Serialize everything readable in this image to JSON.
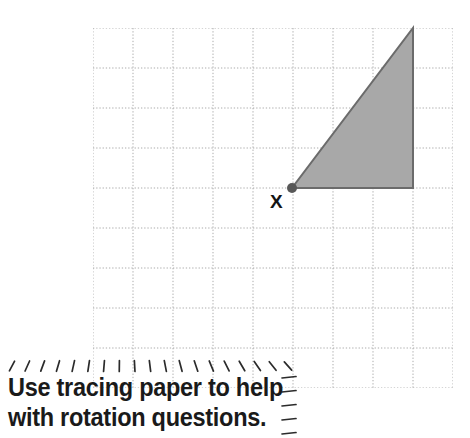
{
  "page": {
    "background_color": "#ffffff",
    "width": 470,
    "height": 438
  },
  "grid": {
    "label": "square grid",
    "origin_x": 93,
    "origin_y": 28,
    "cell_size": 40,
    "columns": 9,
    "rows": 9,
    "line_color": "#8f8f8f",
    "line_style": "dotted"
  },
  "shape": {
    "name": "shaded right triangle",
    "type": "triangle",
    "fill_color": "#a8a8a8",
    "stroke_color": "#6b6b6b",
    "vertices": [
      {
        "label": "X",
        "x": 292,
        "y": 188
      },
      {
        "label": "bottom-right",
        "x": 413,
        "y": 188
      },
      {
        "label": "top-right",
        "x": 413,
        "y": 28
      }
    ],
    "grid_vertices": [
      {
        "label": "X",
        "col": 5,
        "row": 4
      },
      {
        "label": "bottom-right",
        "col": 8,
        "row": 4
      },
      {
        "label": "top-right",
        "col": 8,
        "row": 0
      }
    ]
  },
  "vertex_marker": {
    "name": "centre of rotation point",
    "label": "X",
    "x": 292,
    "y": 188,
    "radius": 5,
    "color": "#585858"
  },
  "callout": {
    "name": "tracing paper hint",
    "line1": "Use tracing paper to help",
    "line2": "with rotation questions.",
    "text_color": "#1a1a1a",
    "border_style": "hand-drawn dashes"
  }
}
